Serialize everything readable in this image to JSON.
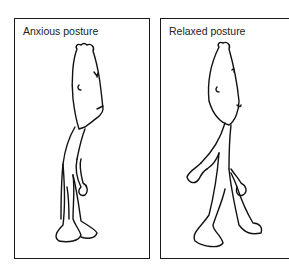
{
  "panels": [
    {
      "id": "anxious",
      "caption": "Anxious posture"
    },
    {
      "id": "relaxed",
      "caption": "Relaxed posture"
    }
  ],
  "colors": {
    "line": "#111111",
    "background": "#ffffff"
  }
}
